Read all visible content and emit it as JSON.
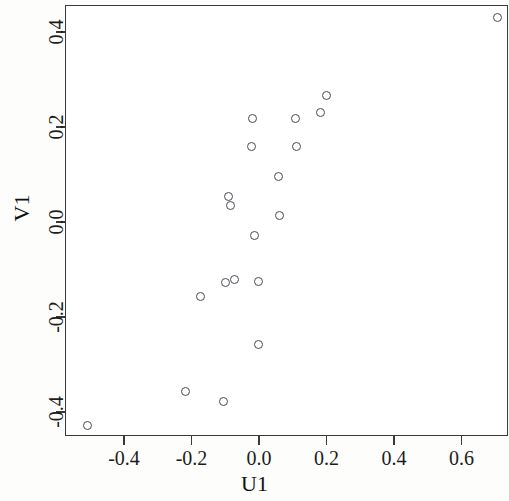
{
  "chart_data": {
    "type": "scatter",
    "title": "",
    "xlabel": "U1",
    "ylabel": "V1",
    "xlim": [
      -0.545,
      0.74
    ],
    "ylim": [
      -0.455,
      0.478
    ],
    "xticks": [
      -0.4,
      -0.2,
      0.0,
      0.2,
      0.4,
      0.6
    ],
    "xtick_labels": [
      "-0.4",
      "-0.2",
      "0.0",
      "0.2",
      "0.4",
      "0.6"
    ],
    "yticks": [
      -0.4,
      -0.2,
      0.0,
      0.2,
      0.4
    ],
    "ytick_labels": [
      "-0.4",
      "-0.2",
      "0.0",
      "0.2",
      "0.4"
    ],
    "grid": false,
    "legend": null,
    "marker": "open-circle",
    "marker_color": "#4a4a52",
    "points": [
      {
        "x": -0.51,
        "y": -0.427
      },
      {
        "x": -0.222,
        "y": -0.354
      },
      {
        "x": -0.175,
        "y": -0.155
      },
      {
        "x": -0.107,
        "y": -0.375
      },
      {
        "x": -0.101,
        "y": -0.125
      },
      {
        "x": -0.092,
        "y": 0.055
      },
      {
        "x": -0.077,
        "y": -0.118
      },
      {
        "x": -0.086,
        "y": 0.036
      },
      {
        "x": -0.021,
        "y": 0.219
      },
      {
        "x": -0.003,
        "y": -0.256
      },
      {
        "x": -0.003,
        "y": -0.123
      },
      {
        "x": -0.015,
        "y": -0.026
      },
      {
        "x": -0.024,
        "y": 0.162
      },
      {
        "x": 0.056,
        "y": 0.098
      },
      {
        "x": 0.057,
        "y": 0.015
      },
      {
        "x": 0.104,
        "y": 0.219
      },
      {
        "x": 0.107,
        "y": 0.162
      },
      {
        "x": 0.178,
        "y": 0.233
      },
      {
        "x": 0.196,
        "y": 0.269
      },
      {
        "x": 0.705,
        "y": 0.432
      }
    ]
  },
  "axis_labels": {
    "x": "U1",
    "y": "V1"
  }
}
